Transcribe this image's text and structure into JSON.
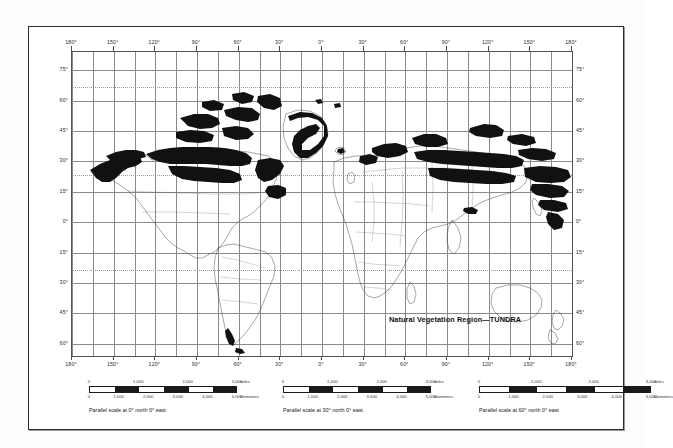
{
  "map": {
    "title": "Natural Vegetation Region—TUNDRA",
    "projection_note": "cylindrical world map",
    "longitude_labels": [
      "180°",
      "150°",
      "120°",
      "90°",
      "60°",
      "30°",
      "0°",
      "30°",
      "60°",
      "90°",
      "120°",
      "150°",
      "180°"
    ],
    "latitude_labels_left": [
      "75°",
      "60°",
      "45°",
      "30°",
      "15°",
      "0°",
      "15°",
      "30°",
      "45°",
      "60°"
    ],
    "latitude_labels_right": [
      "75°",
      "60°",
      "45°",
      "30°",
      "15°",
      "0°",
      "15°",
      "30°",
      "45°",
      "60°"
    ],
    "grid_interval_degrees": 15,
    "label_interval_degrees": 30,
    "colors": {
      "tundra_fill": "#111111",
      "coastline": "#3a3a3a",
      "graticule": "#8a8a8a",
      "frame": "#2b2b2b",
      "page": "#ffffff"
    }
  },
  "scales": [
    {
      "miles_ticks": [
        "0",
        "1,000",
        "2,000",
        "3,000"
      ],
      "miles_unit": "miles",
      "km_ticks": [
        "0",
        "1,000",
        "2,000",
        "3,000",
        "4,000",
        "5,000"
      ],
      "km_unit": "kilometers",
      "caption": "Parallel scale at 0° north 0° east"
    },
    {
      "miles_ticks": [
        "0",
        "1,000",
        "2,000",
        "3,000"
      ],
      "miles_unit": "miles",
      "km_ticks": [
        "0",
        "1,000",
        "2,000",
        "3,000",
        "4,000",
        "5,000"
      ],
      "km_unit": "kilometers",
      "caption": "Parallel scale at 30° north 0° east"
    },
    {
      "miles_ticks": [
        "0",
        "1,000",
        "2,000",
        "3,000"
      ],
      "miles_unit": "miles",
      "km_ticks": [
        "0",
        "1,000",
        "2,000",
        "3,000",
        "4,000",
        "5,000"
      ],
      "km_unit": "kilometers",
      "caption": "Parallel scale at 60° north 0° east"
    }
  ]
}
